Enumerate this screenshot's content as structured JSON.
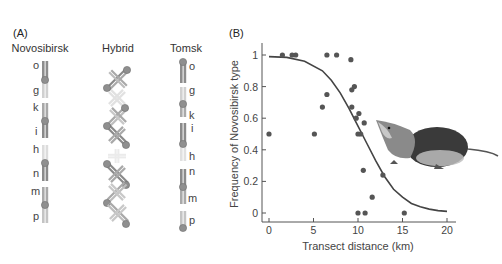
{
  "panel_a": {
    "label": "(A)",
    "columns": [
      {
        "title": "Novosibirsk",
        "letters": [
          "o",
          "g",
          "k",
          "i",
          "h",
          "n",
          "m",
          "p"
        ]
      },
      {
        "title": "Hybrid"
      },
      {
        "title": "Tomsk",
        "letters": [
          "o",
          "g",
          "k",
          "i",
          "h",
          "n",
          "m",
          "p"
        ]
      }
    ],
    "colors": {
      "dark": "#8a8a8a",
      "mid": "#a9a9a9",
      "light": "#d2d2d2",
      "centromere": "#8f8f8f"
    }
  },
  "panel_b": {
    "label": "(B)",
    "image_caption": "shrew-illustration"
  },
  "chart_data": {
    "type": "scatter",
    "title": "",
    "xlabel": "Transect distance (km)",
    "ylabel": "Frequency of Novosibirsk type",
    "xlim": [
      0,
      21
    ],
    "ylim": [
      -0.02,
      1.05
    ],
    "xticks": [
      0,
      5,
      10,
      15,
      20
    ],
    "yticks": [
      0,
      0.2,
      0.4,
      0.6,
      0.8,
      1
    ],
    "ytick_labels": [
      "0",
      "0.2",
      "0.4",
      "0.6",
      "0.8",
      "1"
    ],
    "grid": false,
    "series": [
      {
        "name": "observed",
        "points": [
          [
            0,
            0.5
          ],
          [
            1.5,
            1.0
          ],
          [
            2.6,
            1.0
          ],
          [
            3.0,
            1.0
          ],
          [
            5.1,
            0.5
          ],
          [
            6.0,
            0.67
          ],
          [
            6.5,
            0.75
          ],
          [
            6.5,
            1.0
          ],
          [
            7.6,
            1.0
          ],
          [
            9.2,
            0.97
          ],
          [
            9.6,
            0.8
          ],
          [
            9.3,
            0.78
          ],
          [
            9.3,
            0.67
          ],
          [
            10.1,
            0.63
          ],
          [
            9.8,
            0.6
          ],
          [
            10.7,
            0.57
          ],
          [
            10.0,
            0.5
          ],
          [
            10.3,
            0.5
          ],
          [
            10.6,
            0.27
          ],
          [
            12.8,
            0.24
          ],
          [
            11.6,
            0.1
          ],
          [
            10.0,
            0.0
          ],
          [
            10.8,
            0.0
          ],
          [
            15.2,
            0.0
          ]
        ]
      },
      {
        "name": "fitted cline",
        "type": "line",
        "points": [
          [
            0,
            0.99
          ],
          [
            2,
            0.985
          ],
          [
            4,
            0.96
          ],
          [
            6,
            0.9
          ],
          [
            7,
            0.84
          ],
          [
            8,
            0.76
          ],
          [
            9,
            0.66
          ],
          [
            10,
            0.55
          ],
          [
            11,
            0.44
          ],
          [
            12,
            0.33
          ],
          [
            13,
            0.23
          ],
          [
            14,
            0.15
          ],
          [
            15,
            0.1
          ],
          [
            16,
            0.06
          ],
          [
            17,
            0.04
          ],
          [
            18,
            0.025
          ],
          [
            19,
            0.015
          ],
          [
            20,
            0.01
          ]
        ]
      }
    ]
  }
}
